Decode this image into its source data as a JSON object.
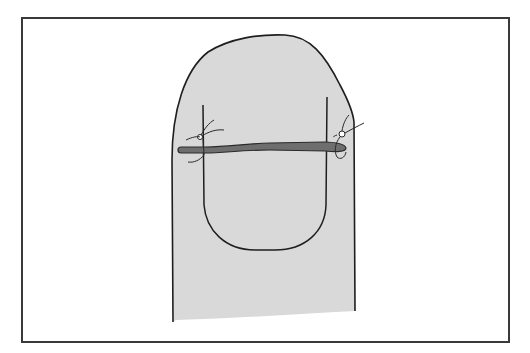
{
  "figure": {
    "colors": {
      "background": "#ffffff",
      "frame": "#3a3a3a",
      "skin_fill": "#d9d9d9",
      "outline": "#1e1e1e",
      "splint_fill": "#6e6e6e",
      "suture": "#2a2a2a"
    },
    "parts": [
      "finger-outline",
      "nail-plate",
      "splint-bar",
      "suture-left",
      "suture-right"
    ]
  }
}
